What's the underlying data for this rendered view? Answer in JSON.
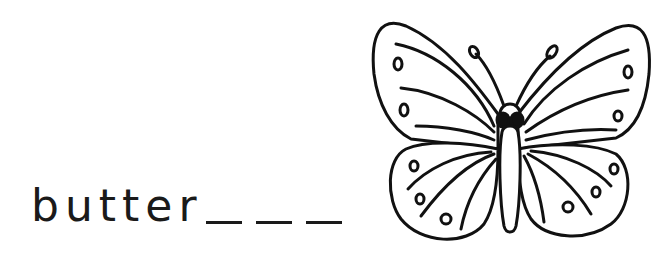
{
  "worksheet": {
    "word_prefix": "butter",
    "blank_count": 3,
    "blanks": [
      "_",
      "_",
      "_"
    ],
    "answer_hidden": "fly"
  },
  "illustration": {
    "subject": "butterfly",
    "style": "black line drawing",
    "stroke_color": "#111111",
    "fill_color": "#ffffff"
  }
}
